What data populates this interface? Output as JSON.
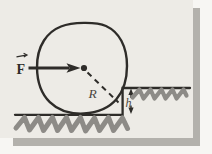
{
  "figure": {
    "labels": {
      "force": "F",
      "radius": "R",
      "step_height": "h"
    },
    "colors": {
      "paper": "#edebe6",
      "page_background": "#f7f6f3",
      "ink": "#2e2c29",
      "pencil": "#4a4641",
      "hatch": "#8d8b87",
      "shadow": "#b3b1ac"
    }
  }
}
